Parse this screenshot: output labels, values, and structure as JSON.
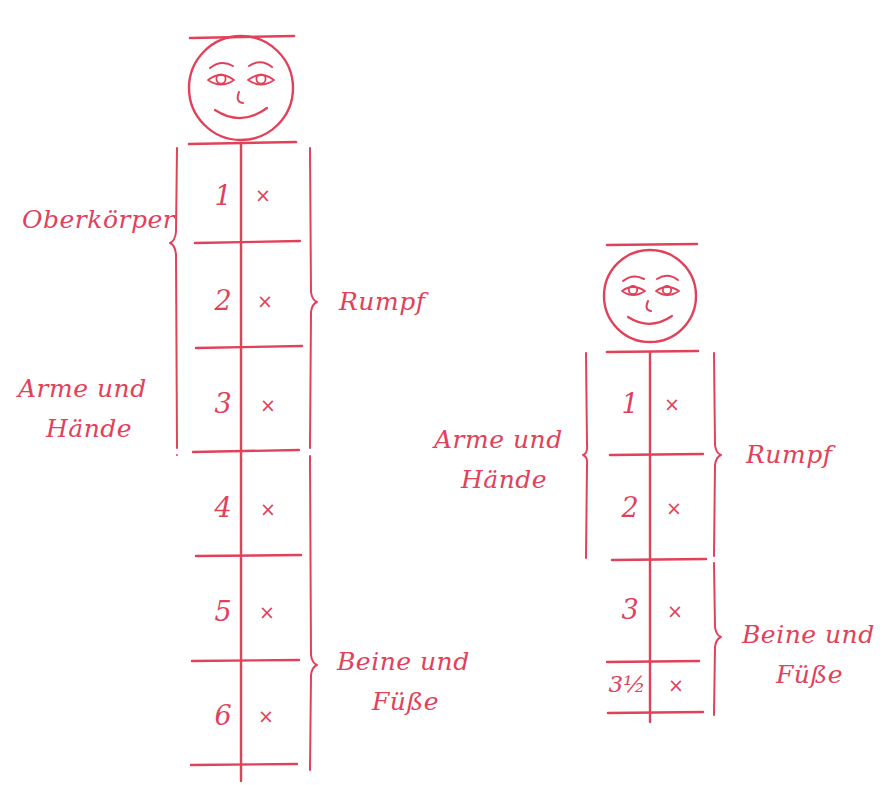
{
  "meta": {
    "ink_color": "#e2415a",
    "background_color": "#ffffff",
    "width": 896,
    "height": 785
  },
  "figures": [
    {
      "id": "left-figure",
      "name": "six-segment-figure",
      "face": {
        "name": "smiley-face",
        "features": [
          "eyebrows",
          "eyes",
          "nose",
          "smile"
        ]
      },
      "segments": [
        {
          "number": "1",
          "mark": "×"
        },
        {
          "number": "2",
          "mark": "×"
        },
        {
          "number": "3",
          "mark": "×"
        },
        {
          "number": "4",
          "mark": "×"
        },
        {
          "number": "5",
          "mark": "×"
        },
        {
          "number": "6",
          "mark": "×"
        }
      ],
      "labels": {
        "left_top": "Oberkörper",
        "left_bottom_line1": "Arme und",
        "left_bottom_line2": "Hände",
        "right_top": "Rumpf",
        "right_bottom_line1": "Beine und",
        "right_bottom_line2": "Füße"
      },
      "braces": [
        {
          "name": "brace-oberkoerper",
          "label": "Oberkörper",
          "covers": [
            "1",
            "2"
          ],
          "side": "left"
        },
        {
          "name": "brace-arme-und-haende",
          "label": "Arme und Hände",
          "covers": [
            "3",
            "4",
            "5",
            "6"
          ],
          "side": "left"
        },
        {
          "name": "brace-rumpf",
          "label": "Rumpf",
          "covers": [
            "1",
            "2",
            "3"
          ],
          "side": "right"
        },
        {
          "name": "brace-beine-und-fuesse",
          "label": "Beine und Füße",
          "covers": [
            "4",
            "5",
            "6"
          ],
          "side": "right"
        }
      ]
    },
    {
      "id": "right-figure",
      "name": "three-and-a-half-segment-figure",
      "face": {
        "name": "smiley-face",
        "features": [
          "eyebrows",
          "eyes",
          "nose",
          "smile"
        ]
      },
      "segments": [
        {
          "number": "1",
          "mark": "×"
        },
        {
          "number": "2",
          "mark": "×"
        },
        {
          "number": "3",
          "mark": "×"
        },
        {
          "number": "3½",
          "mark": "×"
        }
      ],
      "labels": {
        "left_line1": "Arme und",
        "left_line2": "Hände",
        "right_top": "Rumpf",
        "right_bottom_line1": "Beine und",
        "right_bottom_line2": "Füße"
      },
      "braces": [
        {
          "name": "brace-arme-und-haende",
          "label": "Arme und Hände",
          "covers": [
            "1",
            "2"
          ],
          "side": "left"
        },
        {
          "name": "brace-rumpf",
          "label": "Rumpf",
          "covers": [
            "1",
            "2"
          ],
          "side": "right"
        },
        {
          "name": "brace-beine-und-fuesse",
          "label": "Beine und Füße",
          "covers": [
            "3",
            "3½"
          ],
          "side": "right"
        }
      ]
    }
  ]
}
